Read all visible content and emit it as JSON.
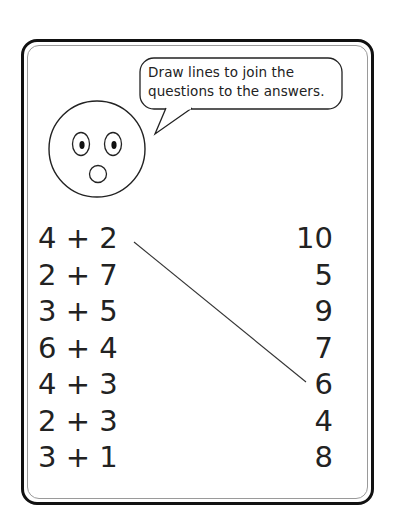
{
  "instruction": {
    "line1": "Draw lines to join the",
    "line2": "questions to the answers."
  },
  "questions": [
    "4 + 2",
    "2 + 7",
    "3 + 5",
    "6 + 4",
    "4 + 3",
    "2 + 3",
    "3 + 1"
  ],
  "answers": [
    "10",
    "5",
    "9",
    "7",
    "6",
    "4",
    "8"
  ],
  "example_connection": {
    "from_question": "4 + 2",
    "to_answer": "6"
  },
  "icons": {
    "face": "surprised-face-icon",
    "speech": "speech-bubble-icon"
  }
}
